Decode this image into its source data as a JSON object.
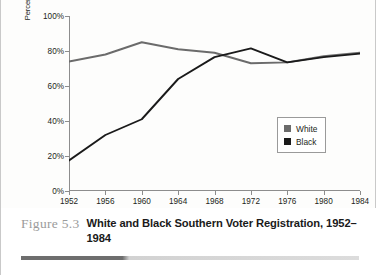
{
  "figure": {
    "number": "Figure 5.3",
    "caption": "White and Black Southern Voter Registration, 1952–1984"
  },
  "colors": {
    "white_series": "#6b6b6b",
    "black_series": "#1a1a1a",
    "axis": "#8d8d8d",
    "text": "#231f20",
    "figure_number": "#9b9b9b"
  },
  "legend": {
    "position": "inside-right",
    "entries": [
      {
        "label": "White",
        "color": "#6b6b6b"
      },
      {
        "label": "Black",
        "color": "#1a1a1a"
      }
    ]
  },
  "chart_data": {
    "type": "line",
    "title": "White and Black Southern Voter Registration, 1952–1984",
    "xlabel": "",
    "ylabel": "Percentage of voting-age population registered to vote",
    "ylabel_lines": [
      "Percentage of voting-age population",
      "registered to vote"
    ],
    "x": [
      1952,
      1956,
      1960,
      1964,
      1968,
      1972,
      1976,
      1980,
      1984
    ],
    "xtick_labels": [
      "1952",
      "1956",
      "1960",
      "1964",
      "1968",
      "1972",
      "1976",
      "1980",
      "1984"
    ],
    "ytick_labels": [
      "0%",
      "20%",
      "40%",
      "60%",
      "80%",
      "100%"
    ],
    "yticks": [
      0,
      20,
      40,
      60,
      80,
      100
    ],
    "ylim": [
      0,
      100
    ],
    "xlim": [
      1952,
      1984
    ],
    "grid": false,
    "series": [
      {
        "name": "White",
        "color": "#6b6b6b",
        "values": [
          74,
          78,
          85,
          81,
          79,
          73,
          73.5,
          77,
          79
        ]
      },
      {
        "name": "Black",
        "color": "#1a1a1a",
        "values": [
          17.5,
          32,
          41,
          64,
          76.5,
          81.5,
          73.5,
          76.5,
          78.5
        ]
      }
    ]
  }
}
